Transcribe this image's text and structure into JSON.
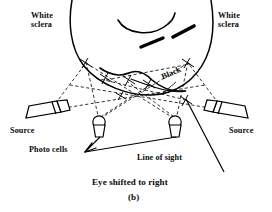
{
  "figure": {
    "caption": "Eye shifted to right",
    "subfigure_label": "(b)",
    "labels": {
      "white_sclera_left": "White\nsclera",
      "white_sclera_right": "White\nsclera",
      "black": "Black",
      "source_left": "Source",
      "source_right": "Source",
      "photo_cells": "Photo cells",
      "line_of_sight": "Line of sight"
    },
    "colors": {
      "ink": "#000000",
      "background": "#ffffff"
    },
    "elements": {
      "eye_outline": "large-circle-arc",
      "iris_arc": "black-iris-boundary-arc",
      "eyelid_curve": "upper-eyelid-arc",
      "eyelash_dashes": 2,
      "photo_cell_count": 2,
      "source_count": 2,
      "ray_style": "dashed",
      "line_of_sight_style": "solid"
    }
  }
}
